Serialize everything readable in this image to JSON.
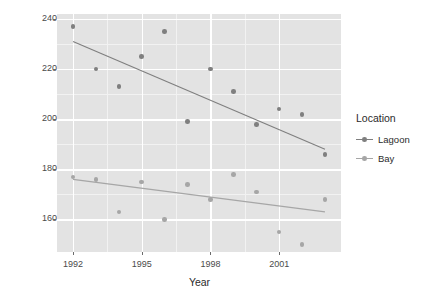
{
  "chart_data": {
    "type": "scatter",
    "title": "",
    "xlabel": "Year",
    "ylabel": "Sea Otter Abundance",
    "xlim": [
      1991.3,
      2003.7
    ],
    "ylim": [
      147,
      242
    ],
    "xticks": [
      1992,
      1995,
      1998,
      2001
    ],
    "xtick_labels": [
      "1992",
      "1995",
      "1998",
      "2001"
    ],
    "yticks": [
      160,
      180,
      200,
      220,
      240
    ],
    "ytick_labels": [
      "160",
      "180",
      "200",
      "220",
      "240"
    ],
    "grid": true,
    "legend_position": "right",
    "legend_title": "Location",
    "series": [
      {
        "name": "Lagoon",
        "color": "#7f7f7f",
        "x": [
          1992,
          1993,
          1994,
          1995,
          1996,
          1997,
          1998,
          1999,
          2000,
          2001,
          2002,
          2003
        ],
        "values": [
          237,
          220,
          213,
          225,
          235,
          199,
          220,
          211,
          198,
          204,
          202,
          186
        ],
        "trend": {
          "x0": 1992,
          "y0": 231,
          "x1": 2003,
          "y1": 188
        }
      },
      {
        "name": "Bay",
        "color": "#a6a6a6",
        "x": [
          1992,
          1993,
          1994,
          1995,
          1996,
          1997,
          1998,
          1999,
          2000,
          2001,
          2002,
          2003
        ],
        "values": [
          177,
          176,
          163,
          175,
          160,
          174,
          168,
          178,
          171,
          155,
          150,
          168
        ],
        "trend": {
          "x0": 1992,
          "y0": 176,
          "x1": 2003,
          "y1": 163
        }
      }
    ]
  },
  "legend": {
    "title": "Location",
    "entries": [
      {
        "label": "Lagoon"
      },
      {
        "label": "Bay"
      }
    ]
  },
  "axes": {
    "y_title": "Sea Otter Abundance",
    "x_title": "Year"
  },
  "colors": {
    "panel_background": "#e3e3e3",
    "grid_major": "#ffffff",
    "lagoon": "#7f7f7f",
    "bay": "#a6a6a6",
    "page_background": "#ffffff"
  }
}
